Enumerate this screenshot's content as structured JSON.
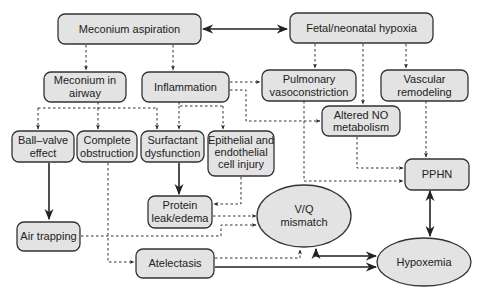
{
  "nodes": {
    "meconium_aspiration": [
      "Meconium aspiration"
    ],
    "fetal_hypoxia": [
      "Fetal/neonatal hypoxia"
    ],
    "meconium_in_airway": [
      "Meconium in",
      "airway"
    ],
    "inflammation": [
      "Inflammation"
    ],
    "pulmonary_vasoconstriction": [
      "Pulmonary",
      "vasoconstriction"
    ],
    "vascular_remodeling": [
      "Vascular",
      "remodeling"
    ],
    "altered_no": [
      "Altered NO",
      "metabolism"
    ],
    "ball_valve": [
      "Ball–valve",
      "effect"
    ],
    "complete_obstruction": [
      "Complete",
      "obstruction"
    ],
    "surfactant_dysfunction": [
      "Surfactant",
      "dysfunction"
    ],
    "epithelial_injury": [
      "Epithelial and",
      "endothelial",
      "cell injury"
    ],
    "pphn": [
      "PPHN"
    ],
    "protein_leak": [
      "Protein",
      "leak/edema"
    ],
    "vq_mismatch": [
      "V/Q",
      "mismatch"
    ],
    "air_trapping": [
      "Air trapping"
    ],
    "atelectasis": [
      "Atelectasis"
    ],
    "hypoxemia": [
      "Hypoxemia"
    ]
  },
  "edges": [
    {
      "from": "meconium_aspiration",
      "to": "fetal_hypoxia",
      "style": "solid",
      "bidirectional": true
    },
    {
      "from": "meconium_aspiration",
      "to": "meconium_in_airway",
      "style": "dashed"
    },
    {
      "from": "meconium_aspiration",
      "to": "inflammation",
      "style": "dashed"
    },
    {
      "from": "fetal_hypoxia",
      "to": "pulmonary_vasoconstriction",
      "style": "dashed"
    },
    {
      "from": "fetal_hypoxia",
      "to": "altered_no",
      "style": "dashed"
    },
    {
      "from": "fetal_hypoxia",
      "to": "vascular_remodeling",
      "style": "dashed"
    },
    {
      "from": "inflammation",
      "to": "pulmonary_vasoconstriction",
      "style": "dashed"
    },
    {
      "from": "inflammation",
      "to": "altered_no",
      "style": "dashed"
    },
    {
      "from": "meconium_in_airway",
      "to": "ball_valve",
      "style": "dashed"
    },
    {
      "from": "meconium_in_airway",
      "to": "complete_obstruction",
      "style": "dashed"
    },
    {
      "from": "meconium_in_airway",
      "to": "surfactant_dysfunction",
      "style": "dashed"
    },
    {
      "from": "inflammation",
      "to": "surfactant_dysfunction",
      "style": "dashed"
    },
    {
      "from": "inflammation",
      "to": "epithelial_injury",
      "style": "dashed"
    },
    {
      "from": "ball_valve",
      "to": "air_trapping",
      "style": "solid"
    },
    {
      "from": "surfactant_dysfunction",
      "to": "protein_leak",
      "style": "solid"
    },
    {
      "from": "epithelial_injury",
      "to": "protein_leak",
      "style": "dashed"
    },
    {
      "from": "complete_obstruction",
      "to": "atelectasis",
      "style": "dashed"
    },
    {
      "from": "protein_leak",
      "to": "vq_mismatch",
      "style": "dashed"
    },
    {
      "from": "air_trapping",
      "to": "vq_mismatch",
      "style": "dashed"
    },
    {
      "from": "atelectasis",
      "to": "vq_mismatch",
      "style": "dashed"
    },
    {
      "from": "atelectasis",
      "to": "hypoxemia",
      "style": "solid"
    },
    {
      "from": "vq_mismatch",
      "to": "hypoxemia",
      "style": "solid",
      "bidirectional": true
    },
    {
      "from": "pulmonary_vasoconstriction",
      "to": "pphn",
      "style": "dashed"
    },
    {
      "from": "altered_no",
      "to": "pphn",
      "style": "dashed"
    },
    {
      "from": "vascular_remodeling",
      "to": "pphn",
      "style": "dashed"
    },
    {
      "from": "pphn",
      "to": "hypoxemia",
      "style": "solid",
      "bidirectional": true
    }
  ]
}
